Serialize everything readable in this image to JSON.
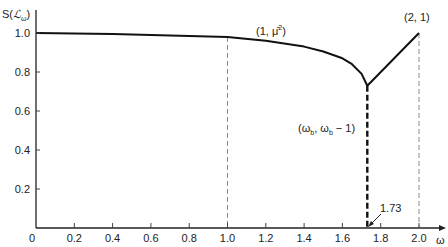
{
  "chart_data": {
    "type": "line",
    "title": "",
    "xlabel": "ω",
    "ylabel": "S(ℒω)",
    "xlim": [
      0,
      2.0
    ],
    "ylim": [
      0,
      1.0
    ],
    "grid": false,
    "x_ticks": [
      "0",
      "0.2",
      "0.4",
      "0.6",
      "0.8",
      "1.0",
      "1.2",
      "1.4",
      "1.6",
      "1.8",
      "2.0"
    ],
    "y_ticks": [
      "0.2",
      "0.4",
      "0.6",
      "0.8",
      "1.0"
    ],
    "series": [
      {
        "name": "S(L_omega)",
        "x": [
          0,
          0.2,
          0.4,
          0.6,
          0.8,
          1.0,
          1.2,
          1.4,
          1.5,
          1.6,
          1.65,
          1.7,
          1.73,
          2.0
        ],
        "y": [
          1.0,
          0.998,
          0.995,
          0.99,
          0.985,
          0.98,
          0.96,
          0.93,
          0.905,
          0.87,
          0.84,
          0.79,
          0.73,
          1.0
        ]
      }
    ],
    "annotations": [
      {
        "text": "(1, μ̄²)",
        "x": 1.0,
        "y": 0.98
      },
      {
        "text": "(2, 1)",
        "x": 2.0,
        "y": 1.0
      },
      {
        "text": "(ωb, ωb − 1)",
        "x": 1.73,
        "y": 0.73
      },
      {
        "text": "1.73",
        "x": 1.73,
        "y": 0
      }
    ],
    "reference_lines": [
      {
        "x": 1.0,
        "style": "thin-dashed"
      },
      {
        "x": 1.73,
        "style": "thick-dashed"
      },
      {
        "x": 2.0,
        "style": "thin-dashed"
      }
    ]
  },
  "labels": {
    "y_axis": "S(",
    "y_axis_script": "ℒ",
    "y_axis_sub": "ω",
    "y_axis_close": ")",
    "x_axis": "ω",
    "ann_mu": "(1, μ̄",
    "ann_mu_sup": "2",
    "ann_mu_close": ")",
    "ann_21": "(2, 1)",
    "ann_wb_open": "(ω",
    "ann_wb_sub1": "b",
    "ann_wb_mid": ", ω",
    "ann_wb_sub2": "b",
    "ann_wb_close": " − 1)",
    "ann_173": "1.73"
  }
}
